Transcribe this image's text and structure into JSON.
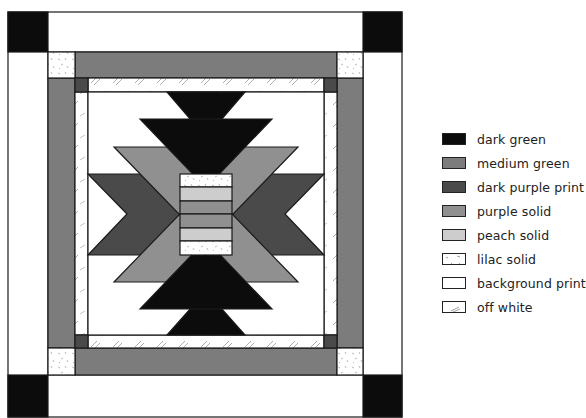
{
  "diagram": {
    "type": "quilt-block-pattern",
    "colors": {
      "dark_green": "#0c0c0c",
      "medium_green": "#7c7c7c",
      "dark_purple_print": "#4a4a4a",
      "purple_solid": "#909090",
      "peach_solid": "#cdcdcd",
      "lilac_solid": "#ffffff",
      "background_print": "#ffffff",
      "off_white": "#ffffff",
      "outline": "#1a1a1a"
    }
  },
  "legend": {
    "items": [
      {
        "label": "dark green",
        "key": "dark_green"
      },
      {
        "label": "medium green",
        "key": "medium_green"
      },
      {
        "label": "dark purple print",
        "key": "dark_purple_print"
      },
      {
        "label": "purple solid",
        "key": "purple_solid"
      },
      {
        "label": "peach solid",
        "key": "peach_solid"
      },
      {
        "label": "lilac solid",
        "key": "lilac_solid"
      },
      {
        "label": "background print",
        "key": "background_print"
      },
      {
        "label": "off white",
        "key": "off_white"
      }
    ]
  }
}
